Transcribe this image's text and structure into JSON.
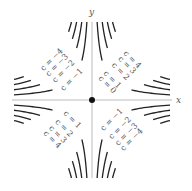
{
  "chart_data": {
    "type": "line",
    "title": "",
    "xlabel": "x",
    "ylabel": "y",
    "xlim": [
      -4,
      4
    ],
    "ylim": [
      -4,
      4
    ],
    "grid": false,
    "legend": "none",
    "origin_marker": {
      "x": 0,
      "y": 0
    },
    "series": [
      {
        "name": "c = 0",
        "c": 0,
        "labels": [
          "c = 0"
        ]
      },
      {
        "name": "c = 1",
        "c": 1,
        "labels": [
          "c = 1",
          "c = 1"
        ]
      },
      {
        "name": "c = 2",
        "c": 2,
        "labels": [
          "c = 2",
          "c = 2"
        ]
      },
      {
        "name": "c = 3",
        "c": 3,
        "labels": [
          "c = 3",
          "c = 3"
        ]
      },
      {
        "name": "c = 4",
        "c": 4,
        "labels": [
          "c = 4",
          "c = 4"
        ]
      },
      {
        "name": "c = -1",
        "c": -1,
        "labels": [
          "c = −1",
          "c = −1"
        ]
      },
      {
        "name": "c = -2",
        "c": -2,
        "labels": [
          "c = −2",
          "c = −2"
        ]
      },
      {
        "name": "c = -3",
        "c": -3,
        "labels": [
          "c = −3",
          "c = −3"
        ]
      },
      {
        "name": "c = -4",
        "c": -4,
        "labels": [
          "c = −4",
          "c = −4"
        ]
      }
    ]
  },
  "axes": {
    "x_label": "x",
    "y_label": "y"
  },
  "style": {
    "curve_color": "#222222",
    "axis_color": "#aaaaaa",
    "label_color": "#555555"
  }
}
